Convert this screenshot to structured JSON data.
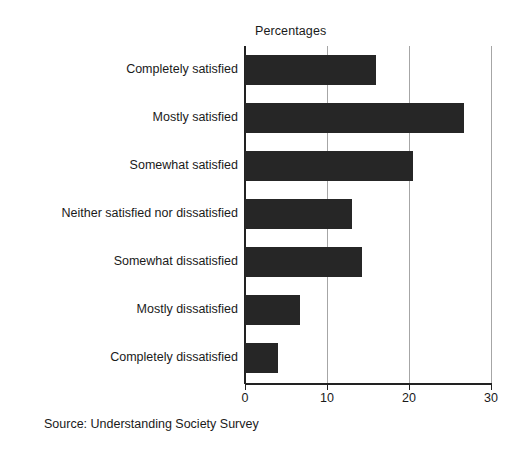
{
  "chart_data": {
    "type": "bar",
    "orientation": "horizontal",
    "title": "Percentages",
    "xlabel": "",
    "ylabel": "",
    "xlim": [
      0,
      30
    ],
    "xticks": [
      "0",
      "10",
      "20",
      "30"
    ],
    "grid": "vertical",
    "legend": "none",
    "bar_color": "#262626",
    "categories": [
      "Completely satisfied",
      "Mostly satisfied",
      "Somewhat satisfied",
      "Neither satisfied nor dissatisfied",
      "Somewhat dissatisfied",
      "Mostly dissatisfied",
      "Completely dissatisfied"
    ],
    "values": [
      16.0,
      26.7,
      20.5,
      13.0,
      14.3,
      6.7,
      4.0
    ],
    "annotations": {
      "source": "Source: Understanding Society Survey"
    }
  },
  "figure": {
    "title": "Percentages",
    "source_note": "Source: Understanding Society Survey",
    "axis_color": "#222222",
    "gridline_color": "#a6a6a6",
    "background": "#ffffff"
  }
}
